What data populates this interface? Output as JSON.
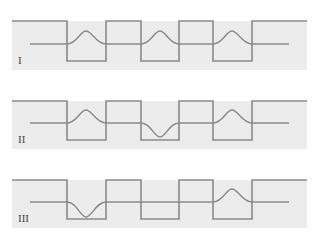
{
  "diagram": {
    "colors": {
      "background": "#ffffff",
      "panel_fill": "#ececec",
      "line": "#8a8a8a"
    },
    "panels": [
      {
        "label": "I",
        "bumps": [
          "up",
          "up",
          "up"
        ]
      },
      {
        "label": "II",
        "bumps": [
          "up",
          "down",
          "up"
        ]
      },
      {
        "label": "III",
        "bumps": [
          "down",
          "flat",
          "up"
        ]
      }
    ]
  }
}
